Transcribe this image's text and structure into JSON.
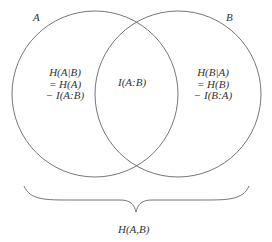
{
  "diagram": {
    "type": "venn",
    "sets": [
      {
        "id": "A",
        "label": "A"
      },
      {
        "id": "B",
        "label": "B"
      }
    ],
    "regions": {
      "a_only": {
        "lines": [
          "H(A|B)",
          "= H(A)",
          "− I(A:B)"
        ]
      },
      "intersection": {
        "text": "I(A:B)"
      },
      "b_only": {
        "lines": [
          "H(B|A)",
          "= H(B)",
          "− I(B:A)"
        ]
      }
    },
    "brace_label": "H(A,B)",
    "stroke_color": "#555555",
    "text_color": "#333333"
  }
}
